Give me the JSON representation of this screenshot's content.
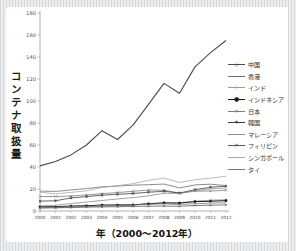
{
  "chart_data": {
    "type": "line",
    "title": "",
    "ylabel": "コンテナ取扱量",
    "xlabel": "年（2000〜2012年）",
    "ylim": [
      0,
      180
    ],
    "ytick_step": 20,
    "grid": false,
    "legend_position": "right",
    "x": [
      2000,
      2001,
      2002,
      2003,
      2004,
      2005,
      2006,
      2007,
      2008,
      2009,
      2010,
      2011,
      2012
    ],
    "series": [
      {
        "name": "中国",
        "color": "#4a4a4a",
        "marker": "◇",
        "values": [
          41,
          45,
          51,
          60,
          73,
          65,
          78,
          97,
          116,
          107,
          131,
          144,
          155
        ]
      },
      {
        "name": "香港",
        "color": "#6e6e6e",
        "marker": "",
        "values": [
          18.1,
          17.8,
          19.1,
          20.4,
          22.0,
          22.6,
          23.5,
          23.9,
          24.5,
          21.0,
          23.7,
          24.4,
          23.1
        ]
      },
      {
        "name": "インド",
        "color": "#9a9a9a",
        "marker": "+",
        "values": [
          2.5,
          2.8,
          3.2,
          3.9,
          4.3,
          4.9,
          5.4,
          6.6,
          7.3,
          7.5,
          8.9,
          9.9,
          10.3
        ]
      },
      {
        "name": "インドネシア",
        "color": "#1a1a1a",
        "marker": "●",
        "values": [
          3.8,
          3.9,
          4.5,
          4.8,
          5.4,
          5.5,
          5.6,
          6.6,
          7.4,
          7.2,
          8.5,
          8.9,
          9.4
        ]
      },
      {
        "name": "日本",
        "color": "#7d7d7d",
        "marker": "×",
        "values": [
          13.1,
          13.2,
          13.6,
          14.6,
          15.8,
          16.8,
          17.9,
          19.0,
          18.9,
          16.3,
          18.1,
          18.1,
          18.9
        ]
      },
      {
        "name": "韓国",
        "color": "#3d3d3d",
        "marker": "∗",
        "values": [
          9.0,
          9.3,
          11.9,
          13.1,
          14.4,
          15.2,
          15.9,
          17.1,
          17.9,
          16.3,
          19.4,
          21.6,
          22.6
        ]
      },
      {
        "name": "マレーシア",
        "color": "#8c8c8c",
        "marker": "",
        "values": [
          4.6,
          5.2,
          6.8,
          8.1,
          9.6,
          10.9,
          12.2,
          13.8,
          16.1,
          15.9,
          18.3,
          20.1,
          20.9
        ]
      },
      {
        "name": "フィリピン",
        "color": "#5a5a5a",
        "marker": "×",
        "values": [
          3.0,
          3.1,
          3.3,
          3.6,
          3.7,
          3.9,
          4.2,
          4.4,
          4.5,
          4.3,
          5.0,
          5.3,
          5.6
        ]
      },
      {
        "name": "シンガポール",
        "color": "#a8a8a8",
        "marker": "",
        "values": [
          17.1,
          15.6,
          16.9,
          18.4,
          21.3,
          23.2,
          24.8,
          27.9,
          29.9,
          25.9,
          28.4,
          29.9,
          31.6
        ]
      },
      {
        "name": "タイ",
        "color": "#777777",
        "marker": "",
        "values": [
          3.2,
          3.4,
          3.8,
          4.2,
          4.8,
          5.1,
          5.6,
          6.1,
          6.5,
          5.9,
          6.6,
          7.2,
          7.5
        ]
      }
    ],
    "axis_color": "#a0a0a0",
    "tick_text_color": "#555555"
  }
}
